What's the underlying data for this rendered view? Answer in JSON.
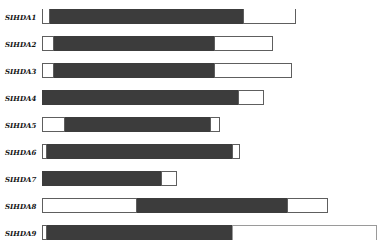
{
  "figure": {
    "title": "",
    "description_visible_text_only": true
  },
  "colors": {
    "background": "#ffffff",
    "bar_fill": "#3c3c3c",
    "bar_outline": "#5e5e5e",
    "bar_outline_light": "#9a9a9a",
    "label_text": "#141414"
  },
  "chart_data": {
    "type": "bar",
    "orientation": "horizontal",
    "title": "",
    "xlabel": "",
    "ylabel": "",
    "grid": false,
    "legend": false,
    "units": "px",
    "categories": [
      "SIHDA1",
      "SIHDA2",
      "SIHDA3",
      "SIHDA4",
      "SIHDA5",
      "SIHDA6",
      "SIHDA7",
      "SIHDA8",
      "SIHDA9"
    ],
    "series": [
      {
        "name": "leading-white-segment",
        "values": [
          8,
          12,
          12,
          0,
          23,
          5,
          0,
          95,
          5
        ]
      },
      {
        "name": "dark-filled-segment",
        "values": [
          193,
          160,
          160,
          196,
          145,
          185,
          119,
          150,
          185
        ]
      },
      {
        "name": "trailing-white-segment",
        "values": [
          53,
          59,
          78,
          26,
          10,
          8,
          16,
          41,
          145
        ]
      }
    ],
    "bar_total_lengths": [
      254,
      231,
      250,
      222,
      178,
      198,
      135,
      286,
      335
    ],
    "lead_border_flags": [
      "no-top",
      "",
      "",
      "",
      "",
      "",
      "",
      "",
      ""
    ],
    "trail_border_flags": [
      "no-top",
      "",
      "",
      "",
      "",
      "",
      "",
      "",
      "no-bottom light"
    ],
    "layout": {
      "bar_left_x": 42,
      "first_row_y": 9,
      "row_pitch": 27,
      "bar_height": 15,
      "label_left_x": 5
    }
  }
}
